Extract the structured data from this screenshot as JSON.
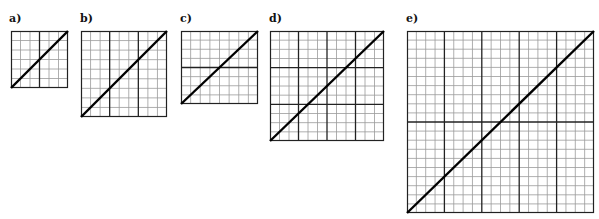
{
  "figure": {
    "panels": [
      {
        "label": "a)",
        "x": 11,
        "y": 31,
        "w": 57,
        "h": 57,
        "cols": 6,
        "rows": 6,
        "major_cols": [
          3
        ],
        "major_rows": [],
        "label_x": 9,
        "label_y": 12
      },
      {
        "label": "b)",
        "x": 81,
        "y": 31,
        "w": 86,
        "h": 86,
        "cols": 9,
        "rows": 9,
        "major_cols": [
          3,
          6
        ],
        "major_rows": [],
        "label_x": 80,
        "label_y": 12
      },
      {
        "label": "c)",
        "x": 181,
        "y": 31,
        "w": 77,
        "h": 73,
        "cols": 8,
        "rows": 8,
        "major_cols": [],
        "major_rows": [
          4
        ],
        "label_x": 180,
        "label_y": 12
      },
      {
        "label": "d)",
        "x": 270,
        "y": 31,
        "w": 114,
        "h": 110,
        "cols": 12,
        "rows": 12,
        "major_cols": [
          3,
          6,
          9
        ],
        "major_rows": [
          4,
          8
        ],
        "label_x": 269,
        "label_y": 12
      },
      {
        "label": "e)",
        "x": 407,
        "y": 31,
        "w": 187,
        "h": 182,
        "cols": 20,
        "rows": 20,
        "major_cols": [
          4,
          8,
          12,
          16
        ],
        "major_rows": [
          10
        ],
        "label_x": 406,
        "label_y": 12
      }
    ],
    "colors": {
      "minor": "#9a9a9a",
      "major": "#222222",
      "border": "#222222",
      "diagonal": "#000000"
    }
  }
}
